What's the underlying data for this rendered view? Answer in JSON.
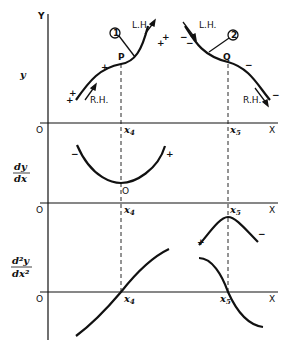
{
  "diagram": {
    "panels": [
      {
        "id": "y",
        "ylabel": "y",
        "axis_label_y": "Y",
        "origin": "O",
        "x_axis": "X",
        "points": {
          "P": "P",
          "Q": "Q"
        },
        "markers": [
          "x4",
          "x5"
        ],
        "curve1": {
          "circle": "1",
          "lh": "L.H.",
          "rh": "R.H.",
          "signs": [
            "+",
            "+",
            "+",
            "+",
            "+"
          ]
        },
        "curve2": {
          "circle": "2",
          "lh": "L.H.",
          "rh": "R.H.",
          "signs": [
            "−",
            "−",
            "−",
            "−"
          ]
        }
      },
      {
        "id": "dy_dx",
        "ylabel_num": "dy",
        "ylabel_den": "dx",
        "origin": "O",
        "x_axis": "X",
        "min_label": "O",
        "signs": {
          "left": "−",
          "right": "+"
        }
      },
      {
        "id": "d2y_dx2",
        "ylabel_num": "d²y",
        "ylabel_den": "dx²",
        "origin": "O",
        "x_axis": "X",
        "signs": {
          "left": "+",
          "right": "−"
        }
      }
    ],
    "tick_labels": {
      "x4": "x",
      "x4_sub": "4",
      "x5": "x",
      "x5_sub": "5"
    },
    "colors": {
      "ink": "#111111",
      "background": "#ffffff"
    }
  }
}
